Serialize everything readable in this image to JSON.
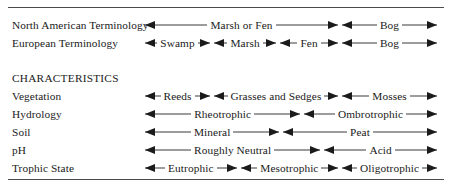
{
  "figure": {
    "section_heading": "CHARACTERISTICS",
    "accent_color": "#1b1b1b",
    "rule_color": "#4a4a4a"
  },
  "terminology_rows": [
    {
      "label": "North American Terminology",
      "segments": [
        {
          "caption": "Marsh or Fen",
          "start_pct": 0,
          "end_pct": 66.1
        },
        {
          "caption": "Bog",
          "start_pct": 67.5,
          "end_pct": 100
        }
      ]
    },
    {
      "label": "European Terminology",
      "segments": [
        {
          "caption": "Swamp",
          "start_pct": 0,
          "end_pct": 22.3
        },
        {
          "caption": "Marsh",
          "start_pct": 23.6,
          "end_pct": 45.0
        },
        {
          "caption": "Fen",
          "start_pct": 46.3,
          "end_pct": 66.1
        },
        {
          "caption": "Bog",
          "start_pct": 67.5,
          "end_pct": 100
        }
      ]
    }
  ],
  "characteristics_rows": [
    {
      "label": "Vegetation",
      "segments": [
        {
          "caption": "Reeds",
          "start_pct": 0,
          "end_pct": 22.3
        },
        {
          "caption": "Grasses and Sedges",
          "start_pct": 23.6,
          "end_pct": 66.1
        },
        {
          "caption": "Mosses",
          "start_pct": 67.5,
          "end_pct": 100
        }
      ]
    },
    {
      "label": "Hydrology",
      "segments": [
        {
          "caption": "Rheotrophic",
          "start_pct": 0,
          "end_pct": 53.2
        },
        {
          "caption": "Ombrotrophic",
          "start_pct": 54.5,
          "end_pct": 100
        }
      ]
    },
    {
      "label": "Soil",
      "segments": [
        {
          "caption": "Mineral",
          "start_pct": 0,
          "end_pct": 46.0
        },
        {
          "caption": "Peat",
          "start_pct": 47.3,
          "end_pct": 100
        }
      ]
    },
    {
      "label": "pH",
      "segments": [
        {
          "caption": "Roughly Neutral",
          "start_pct": 0,
          "end_pct": 60.0
        },
        {
          "caption": "Acid",
          "start_pct": 61.4,
          "end_pct": 100
        }
      ]
    },
    {
      "label": "Trophic State",
      "segments": [
        {
          "caption": "Eutrophic",
          "start_pct": 0,
          "end_pct": 31.4
        },
        {
          "caption": "Mesotrophic",
          "start_pct": 32.8,
          "end_pct": 66.1
        },
        {
          "caption": "Oligotrophic",
          "start_pct": 67.5,
          "end_pct": 100
        }
      ]
    }
  ],
  "chart_data": {
    "type": "table",
    "xlabel": "Hydrological / nutrient gradient (mineral-rich, flowing water → rain-fed, nutrient-poor)",
    "ylabel": "",
    "grid": false,
    "legend": "none",
    "rows": [
      {
        "name": "North American Terminology",
        "group": "terminology",
        "bands": [
          "Marsh or Fen",
          "Bog"
        ],
        "band_extents_pct": [
          [
            0,
            66
          ],
          [
            68,
            100
          ]
        ]
      },
      {
        "name": "European Terminology",
        "group": "terminology",
        "bands": [
          "Swamp",
          "Marsh",
          "Fen",
          "Bog"
        ],
        "band_extents_pct": [
          [
            0,
            22
          ],
          [
            24,
            45
          ],
          [
            46,
            66
          ],
          [
            68,
            100
          ]
        ]
      },
      {
        "name": "Vegetation",
        "group": "characteristics",
        "bands": [
          "Reeds",
          "Grasses and Sedges",
          "Mosses"
        ],
        "band_extents_pct": [
          [
            0,
            22
          ],
          [
            24,
            66
          ],
          [
            68,
            100
          ]
        ]
      },
      {
        "name": "Hydrology",
        "group": "characteristics",
        "bands": [
          "Rheotrophic",
          "Ombrotrophic"
        ],
        "band_extents_pct": [
          [
            0,
            53
          ],
          [
            55,
            100
          ]
        ]
      },
      {
        "name": "Soil",
        "group": "characteristics",
        "bands": [
          "Mineral",
          "Peat"
        ],
        "band_extents_pct": [
          [
            0,
            46
          ],
          [
            47,
            100
          ]
        ]
      },
      {
        "name": "pH",
        "group": "characteristics",
        "bands": [
          "Roughly Neutral",
          "Acid"
        ],
        "band_extents_pct": [
          [
            0,
            60
          ],
          [
            61,
            100
          ]
        ]
      },
      {
        "name": "Trophic State",
        "group": "characteristics",
        "bands": [
          "Eutrophic",
          "Mesotrophic",
          "Oligotrophic"
        ],
        "band_extents_pct": [
          [
            0,
            31
          ],
          [
            33,
            66
          ],
          [
            68,
            100
          ]
        ]
      }
    ]
  }
}
